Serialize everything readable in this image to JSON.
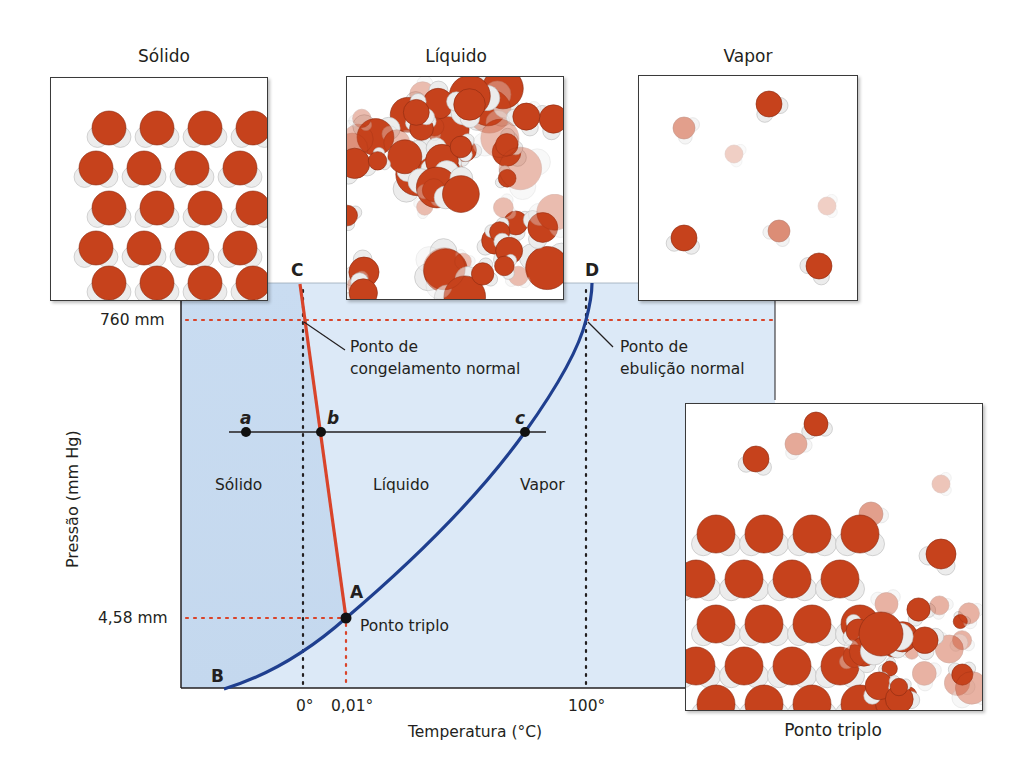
{
  "panels": {
    "solid": {
      "title": "Sólido"
    },
    "liquid": {
      "title": "Líquido"
    },
    "vapor": {
      "title": "Vapor"
    },
    "triple_point": {
      "caption": "Ponto triplo"
    }
  },
  "diagram": {
    "y_axis_label": "Pressão (mm Hg)",
    "x_axis_label": "Temperatura (°C)",
    "y_ticks": [
      "760 mm",
      "4,58 mm"
    ],
    "x_ticks": [
      "0°",
      "0,01°",
      "100°"
    ],
    "region_labels": {
      "solid": "Sólido",
      "liquid": "Líquido",
      "vapor": "Vapor"
    },
    "point_letters": {
      "A": "A",
      "B": "B",
      "C": "C",
      "D": "D"
    },
    "line_points": {
      "a": "a",
      "b": "b",
      "c": "c"
    },
    "annotations": {
      "freezing_line1": "Ponto de",
      "freezing_line2": "congelamento normal",
      "boiling_line1": "Ponto de",
      "boiling_line2": "ebulição normal",
      "triple": "Ponto triplo"
    },
    "colors": {
      "solid_region": "#c8dbf0",
      "fluid_region": "#dce9f7",
      "fusion_curve": "#d9442a",
      "vaporization_curve": "#1f3f8f",
      "reference_dots_red": "#d9442a",
      "reference_dots_black": "#231f20",
      "oxygen": "#c6421c",
      "hydrogen": "#ececec"
    }
  },
  "chart_data": {
    "type": "line",
    "xlabel": "Temperatura (°C)",
    "ylabel": "Pressão (mm Hg)",
    "x_ticks": [
      "0°",
      "0,01°",
      "100°"
    ],
    "y_ticks": [
      "4,58 mm",
      "760 mm"
    ],
    "series": [
      {
        "name": "Curva de fusão (A–C)",
        "points": [
          {
            "label": "A",
            "x": 0.01,
            "y": 4.58
          },
          {
            "label": "C",
            "x": -0.0075,
            "y": "above 760"
          }
        ]
      },
      {
        "name": "Curva de vaporização/sublimação (B–A–D)",
        "points": [
          {
            "label": "B",
            "x": "below 0",
            "y": 0
          },
          {
            "label": "A",
            "x": 0.01,
            "y": 4.58
          },
          {
            "label": "D",
            "x": 100,
            "y": 760
          }
        ]
      }
    ],
    "key_points": [
      {
        "name": "Ponto triplo",
        "x": 0.01,
        "y": 4.58
      },
      {
        "name": "Ponto de congelamento normal",
        "x": 0,
        "y": 760
      },
      {
        "name": "Ponto de ebulição normal",
        "x": 100,
        "y": 760
      }
    ],
    "isobar_points": [
      "a",
      "b",
      "c"
    ],
    "regions": [
      "Sólido",
      "Líquido",
      "Vapor"
    ],
    "grid": false
  }
}
